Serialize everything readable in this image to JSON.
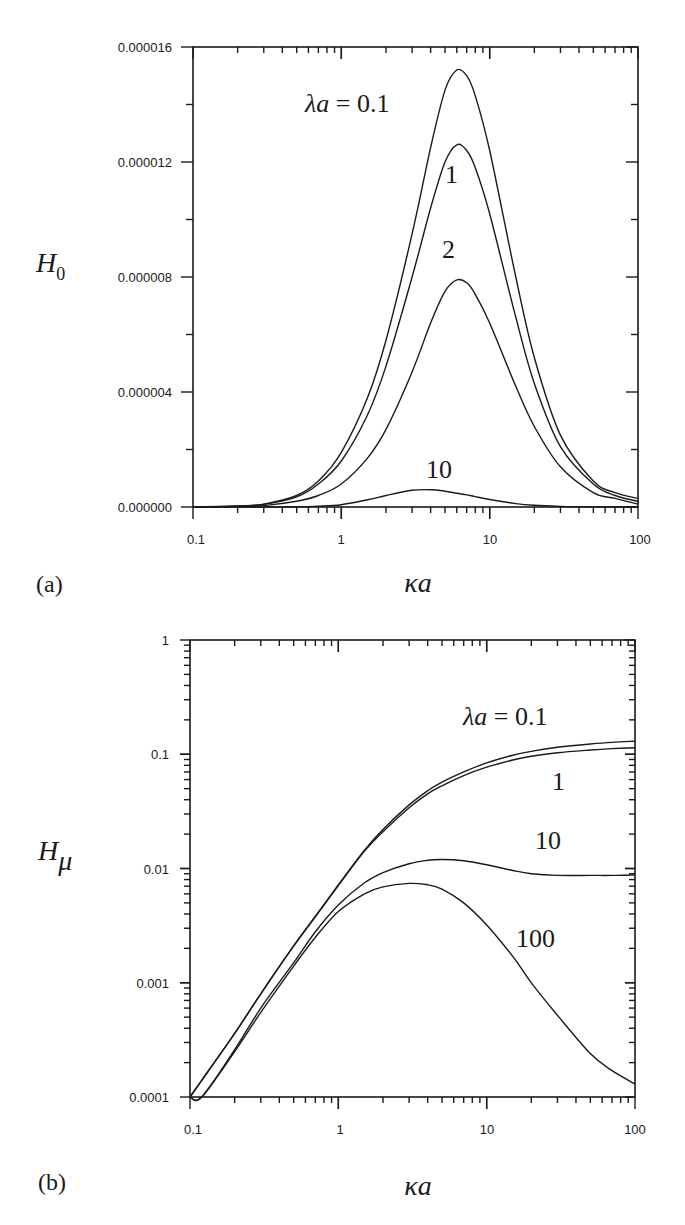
{
  "chart_data": [
    {
      "panel": "(a)",
      "type": "line",
      "title": "",
      "xlabel": "κa",
      "ylabel": "H0",
      "ylabel_main": "H",
      "ylabel_sub": "0",
      "xscale": "log",
      "xlim": [
        0.1,
        100
      ],
      "ylim": [
        0.0,
        1.6e-05
      ],
      "xticks": [
        "0.1",
        "1",
        "10",
        "100"
      ],
      "yticks": [
        "0.000000",
        "0.000004",
        "0.000008",
        "0.000012",
        "0.000016"
      ],
      "grid": false,
      "legend": "inline curve labels",
      "annotations": [
        "λa = 0.1",
        "1",
        "2",
        "10"
      ],
      "x": [
        0.1,
        0.2,
        0.3,
        0.5,
        0.7,
        1,
        1.5,
        2,
        3,
        4,
        5,
        6,
        7,
        8,
        10,
        15,
        20,
        30,
        50,
        70,
        100
      ],
      "series": [
        {
          "name": "λa = 0.1",
          "values": [
            0,
            4e-08,
            1e-07,
            4e-07,
            9e-07,
            1.9e-06,
            3.8e-06,
            5.8e-06,
            9.5e-06,
            1.25e-05,
            1.45e-05,
            1.52e-05,
            1.5e-05,
            1.43e-05,
            1.24e-05,
            8e-06,
            5.2e-06,
            2.5e-06,
            9e-07,
            5e-07,
            3e-07
          ]
        },
        {
          "name": "λa = 1",
          "values": [
            0,
            3e-08,
            9e-08,
            3.5e-07,
            8e-07,
            1.6e-06,
            3.2e-06,
            4.9e-06,
            8e-06,
            1.04e-05,
            1.2e-05,
            1.26e-05,
            1.24e-05,
            1.18e-05,
            1.02e-05,
            6.6e-06,
            4.3e-06,
            2.1e-06,
            8e-07,
            4e-07,
            2e-07
          ]
        },
        {
          "name": "λa = 2",
          "values": [
            0,
            2e-08,
            5e-08,
            2e-07,
            4e-07,
            8e-07,
            1.7e-06,
            2.7e-06,
            4.7e-06,
            6.4e-06,
            7.5e-06,
            7.9e-06,
            7.8e-06,
            7.4e-06,
            6.4e-06,
            4.2e-06,
            2.8e-06,
            1.4e-06,
            5e-07,
            3e-07,
            1e-07
          ]
        },
        {
          "name": "λa = 10",
          "values": [
            0,
            0,
            0,
            1e-08,
            3e-08,
            8e-08,
            2.5e-07,
            4e-07,
            5.8e-07,
            6e-07,
            5.5e-07,
            4.8e-07,
            4.2e-07,
            3.6e-07,
            2.6e-07,
            1.2e-07,
            6e-08,
            2e-08,
            0,
            0,
            0
          ]
        }
      ]
    },
    {
      "panel": "(b)",
      "type": "line",
      "title": "",
      "xlabel": "κa",
      "ylabel": "Hμ",
      "ylabel_main": "H",
      "ylabel_sub": "μ",
      "xscale": "log",
      "yscale": "log",
      "xlim": [
        0.1,
        100
      ],
      "ylim": [
        0.0001,
        1
      ],
      "xticks": [
        "0.1",
        "1",
        "10",
        "100"
      ],
      "yticks": [
        "0.0001",
        "0.001",
        "0.01",
        "0.1",
        "1"
      ],
      "grid": false,
      "legend": "inline curve labels",
      "annotations": [
        "λa = 0.1",
        "1",
        "10",
        "100"
      ],
      "x": [
        0.1,
        0.12,
        0.2,
        0.3,
        0.5,
        0.7,
        1,
        1.5,
        2,
        3,
        4,
        5,
        7,
        10,
        15,
        20,
        30,
        50,
        70,
        100
      ],
      "series": [
        {
          "name": "λa = 0.1",
          "values": [
            0.0001,
            0.00014,
            0.00036,
            0.0008,
            0.0021,
            0.0038,
            0.0072,
            0.0145,
            0.022,
            0.036,
            0.048,
            0.057,
            0.07,
            0.084,
            0.098,
            0.106,
            0.115,
            0.123,
            0.127,
            0.13
          ]
        },
        {
          "name": "λa = 1",
          "values": [
            0.0001,
            0.00014,
            0.00036,
            0.0008,
            0.0021,
            0.0038,
            0.0071,
            0.0142,
            0.021,
            0.034,
            0.045,
            0.053,
            0.065,
            0.077,
            0.089,
            0.096,
            0.103,
            0.109,
            0.112,
            0.114
          ]
        },
        {
          "name": "λa = 10",
          "values": [
            8e-05,
            0.0001,
            0.00026,
            0.0006,
            0.0015,
            0.0028,
            0.0048,
            0.0075,
            0.0092,
            0.011,
            0.0118,
            0.012,
            0.0117,
            0.0108,
            0.0096,
            0.009,
            0.0087,
            0.0087,
            0.0087,
            0.0088
          ]
        },
        {
          "name": "λa = 100",
          "values": [
            8e-05,
            0.0001,
            0.00025,
            0.00055,
            0.0014,
            0.0025,
            0.0042,
            0.006,
            0.0069,
            0.0074,
            0.0072,
            0.0066,
            0.005,
            0.0032,
            0.0017,
            0.001,
            0.00052,
            0.00024,
            0.00017,
            0.00013
          ]
        }
      ]
    }
  ]
}
